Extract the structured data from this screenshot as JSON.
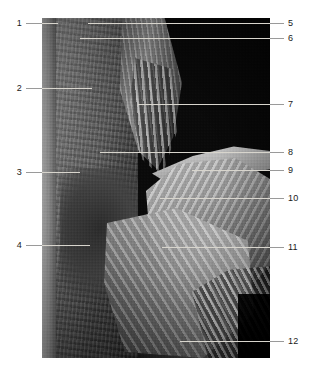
{
  "figure": {
    "kind": "anatomical-dissection-photograph",
    "orientation": "portrait",
    "color_mode": "grayscale",
    "photo_bounds": {
      "x": 42,
      "y": 18,
      "width": 228,
      "height": 340
    },
    "label_color": "#1a1a1a",
    "leader_color": "#9a9a9a",
    "leader_color_over_photo": "#d8d5cd",
    "background_color": "#ffffff"
  },
  "labels": {
    "left": [
      {
        "id": "1",
        "text": "1",
        "y": 23,
        "num_x": 18,
        "line_x1": 26,
        "line_x2": 58
      },
      {
        "id": "2",
        "text": "2",
        "y": 88,
        "num_x": 18,
        "line_x1": 26,
        "line_x2": 92
      },
      {
        "id": "3",
        "text": "3",
        "y": 172,
        "num_x": 18,
        "line_x1": 26,
        "line_x2": 80
      },
      {
        "id": "4",
        "text": "4",
        "y": 245,
        "num_x": 18,
        "line_x1": 26,
        "line_x2": 90
      }
    ],
    "right": [
      {
        "id": "5",
        "text": "5",
        "y": 23,
        "num_x": 288,
        "line_x1": 88,
        "line_x2": 284
      },
      {
        "id": "6",
        "text": "6",
        "y": 38,
        "num_x": 288,
        "line_x1": 80,
        "line_x2": 284
      },
      {
        "id": "7",
        "text": "7",
        "y": 104,
        "num_x": 288,
        "line_x1": 138,
        "line_x2": 284
      },
      {
        "id": "8",
        "text": "8",
        "y": 152,
        "num_x": 288,
        "line_x1": 100,
        "line_x2": 284
      },
      {
        "id": "9",
        "text": "9",
        "y": 170,
        "num_x": 288,
        "line_x1": 192,
        "line_x2": 284
      },
      {
        "id": "10",
        "text": "10",
        "y": 198,
        "num_x": 288,
        "line_x1": 160,
        "line_x2": 284
      },
      {
        "id": "11",
        "text": "11",
        "y": 247,
        "num_x": 288,
        "line_x1": 162,
        "line_x2": 284
      },
      {
        "id": "12",
        "text": "12",
        "y": 341,
        "num_x": 288,
        "line_x1": 180,
        "line_x2": 284
      }
    ]
  },
  "regions": [
    {
      "name": "black-background-void",
      "note": "upper-right dark field"
    },
    {
      "name": "left-tissue-slab",
      "note": "vertical pale tissue column at left"
    },
    {
      "name": "strap-muscle-column",
      "note": "banded fibrous strands, upper centre"
    },
    {
      "name": "clavicle-ridge",
      "note": "bright horizontal ridge"
    },
    {
      "name": "deltoid-mass",
      "note": "large pale muscle belly, right"
    },
    {
      "name": "pectoral-sheet",
      "note": "fan of fibres, lower centre"
    },
    {
      "name": "arm-strands",
      "note": "fibre bundles, lower right"
    }
  ]
}
